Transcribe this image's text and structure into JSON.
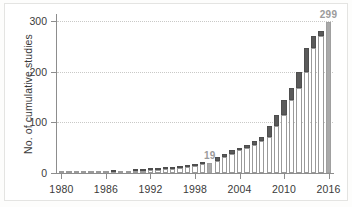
{
  "chart_data": {
    "type": "bar",
    "title": "",
    "subtitle": "",
    "xlabel": "",
    "ylabel": "No. of cumulative studies",
    "xlim": [
      1979.4,
      2016.6
    ],
    "ylim": [
      0,
      310
    ],
    "grid": "horizontal-dotted",
    "legend": "none",
    "stacked": true,
    "x_tick_labels": [
      "1980",
      "1986",
      "1992",
      "1998",
      "2004",
      "2010",
      "2016"
    ],
    "x_tick_values": [
      1980,
      1986,
      1992,
      1998,
      2004,
      2010,
      2016
    ],
    "y_tick_labels": [
      "0",
      "100",
      "200",
      "300"
    ],
    "y_tick_values": [
      0,
      100,
      200,
      300
    ],
    "categories": [
      "1980",
      "1981",
      "1982",
      "1983",
      "1984",
      "1985",
      "1986",
      "1987",
      "1988",
      "1989",
      "1990",
      "1991",
      "1992",
      "1993",
      "1994",
      "1995",
      "1996",
      "1997",
      "1998",
      "1999",
      "2000",
      "2001",
      "2002",
      "2003",
      "2004",
      "2005",
      "2006",
      "2007",
      "2008",
      "2009",
      "2010",
      "2011",
      "2012",
      "2013",
      "2014",
      "2015",
      "2016"
    ],
    "series": [
      {
        "name": "cumulative total (prior)",
        "color": "#ffffff",
        "values": [
          1,
          1,
          1,
          1,
          2,
          2,
          2,
          2,
          3,
          3,
          3,
          4,
          5,
          6,
          7,
          8,
          10,
          12,
          14,
          17,
          19,
          24,
          31,
          38,
          45,
          49,
          56,
          63,
          72,
          92,
          114,
          145,
          168,
          200,
          246,
          271,
          299
        ]
      },
      {
        "name": "new in year",
        "color": "#5a5a5a",
        "values": [
          0,
          0,
          0,
          0,
          0,
          0,
          0,
          1,
          0,
          0,
          1,
          1,
          1,
          1,
          1,
          2,
          2,
          2,
          3,
          2,
          0,
          7,
          7,
          7,
          4,
          7,
          7,
          9,
          20,
          22,
          31,
          23,
          32,
          46,
          25,
          9,
          0
        ]
      }
    ],
    "cumulative_totals": [
      1,
      1,
      1,
      1,
      2,
      2,
      2,
      3,
      3,
      3,
      4,
      5,
      6,
      7,
      8,
      10,
      12,
      14,
      17,
      19,
      19,
      31,
      38,
      45,
      49,
      56,
      63,
      72,
      92,
      114,
      145,
      168,
      200,
      246,
      271,
      280,
      299
    ],
    "annotations": [
      {
        "label": "19",
        "category": "2000",
        "value": 19,
        "color": "#9b9b9b"
      },
      {
        "label": "299",
        "category": "2016",
        "value": 299,
        "color": "#9b9b9b"
      }
    ],
    "highlighted_categories": [
      "2000",
      "2016"
    ],
    "highlight_color": "#a9a9a9",
    "axis_color": "#8d8d8d",
    "grid_color": "#c9c9c7",
    "text_color": "#3a3a3a",
    "background_color": "#ffffff"
  }
}
